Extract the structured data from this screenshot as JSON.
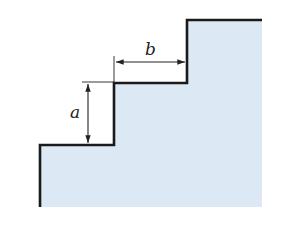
{
  "diagram": {
    "labels": {
      "rise": "a",
      "run": "b"
    },
    "colors": {
      "fill": "#dce9f5",
      "outline": "#1a1a1a",
      "dimension": "#222222"
    }
  }
}
